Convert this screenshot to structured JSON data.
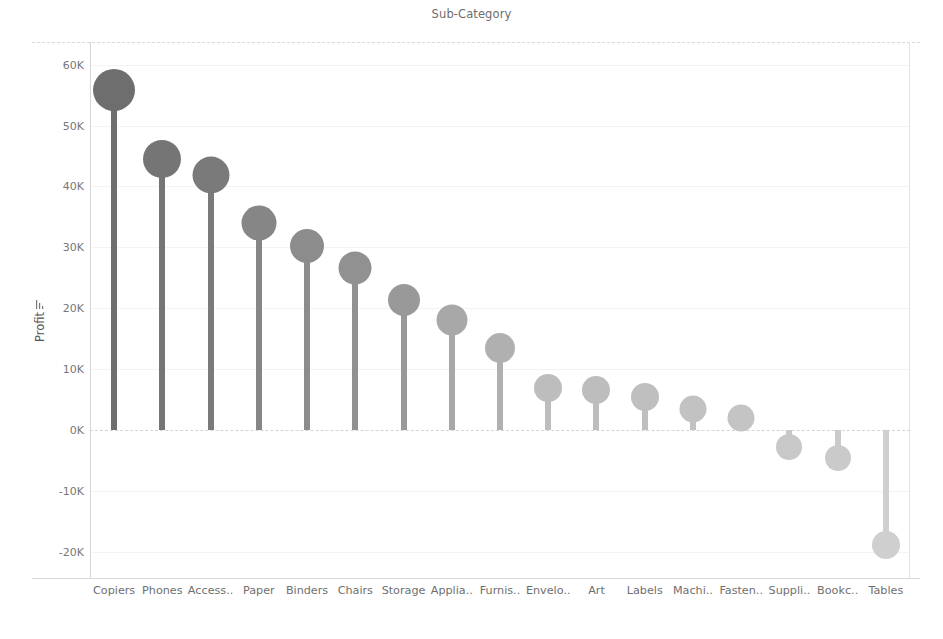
{
  "chart_data": {
    "type": "bar",
    "subtype": "lollipop",
    "title": "Sub-Category",
    "xlabel": "",
    "ylabel": "Profit",
    "ylabel_sort_icon": "sort-descending-icon",
    "ylim": [
      -24000,
      63000
    ],
    "ytick_labels": [
      "60K",
      "50K",
      "40K",
      "30K",
      "20K",
      "10K",
      "0K",
      "-10K",
      "-20K"
    ],
    "ytick_values": [
      60000,
      50000,
      40000,
      30000,
      20000,
      10000,
      0,
      -10000,
      -20000
    ],
    "grid": true,
    "legend": "none",
    "categories": [
      "Copiers",
      "Phones",
      "Access..",
      "Paper",
      "Binders",
      "Chairs",
      "Storage",
      "Applia..",
      "Furnis..",
      "Envelo..",
      "Art",
      "Labels",
      "Machi..",
      "Fasten..",
      "Suppli..",
      "Bookc..",
      "Tables"
    ],
    "values": [
      55800,
      44500,
      41900,
      34000,
      30200,
      26600,
      21300,
      18100,
      13400,
      6900,
      6500,
      5500,
      3400,
      2000,
      -2800,
      -4600,
      -18900
    ],
    "colors": [
      "#6e6e6e",
      "#757575",
      "#7a7a7a",
      "#868686",
      "#8c8c8c",
      "#919191",
      "#999999",
      "#a8a8a8",
      "#b0b0b0",
      "#bdbdbd",
      "#bdbdbd",
      "#bfbfbf",
      "#c2c2c2",
      "#c4c4c4",
      "#c8c8c8",
      "#cacaca",
      "#cfcfcf"
    ],
    "stem_colors": [
      "#6e6e6e",
      "#757575",
      "#7a7a7a",
      "#868686",
      "#8c8c8c",
      "#919191",
      "#999999",
      "#a8a8a8",
      "#b0b0b0",
      "#bdbdbd",
      "#bdbdbd",
      "#bfbfbf",
      "#c2c2c2",
      "#c4c4c4",
      "#c8c8c8",
      "#cacaca",
      "#cfcfcf"
    ],
    "marker_radii": [
      21,
      19,
      18.5,
      17.5,
      17,
      16.5,
      16,
      15.5,
      15,
      14,
      14,
      14,
      13.5,
      13.5,
      13,
      13,
      14
    ]
  }
}
